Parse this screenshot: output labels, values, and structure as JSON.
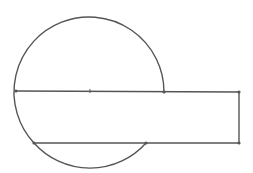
{
  "diagram": {
    "stroke_color": "#555555",
    "background": "#ffffff",
    "circle": {
      "cx": 90,
      "cy": 91,
      "r": 75
    },
    "center_point": {
      "x": 90,
      "y": 91
    },
    "points": [
      {
        "name": "diameter-left",
        "x": 16,
        "y": 91
      },
      {
        "name": "diameter-right-on-circle",
        "x": 164,
        "y": 92
      },
      {
        "name": "rect-top-right",
        "x": 239,
        "y": 92
      },
      {
        "name": "rect-bottom-right",
        "x": 239,
        "y": 143
      },
      {
        "name": "chord-right-on-circle",
        "x": 146,
        "y": 143
      },
      {
        "name": "chord-left-on-circle",
        "x": 34,
        "y": 143
      }
    ],
    "segments": [
      {
        "name": "top-line",
        "x1": 16,
        "y1": 91,
        "x2": 239,
        "y2": 92
      },
      {
        "name": "right-line",
        "x1": 239,
        "y1": 92,
        "x2": 239,
        "y2": 143
      },
      {
        "name": "bottom-line",
        "x1": 34,
        "y1": 143,
        "x2": 239,
        "y2": 143
      }
    ]
  }
}
